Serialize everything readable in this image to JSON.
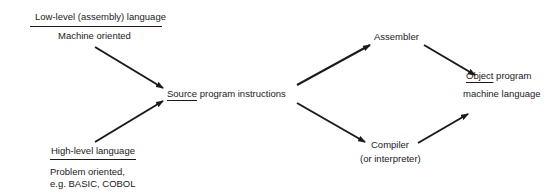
{
  "diagram": {
    "low_level": {
      "title": "Low-level (assembly) language",
      "subtitle": "Machine oriented"
    },
    "high_level": {
      "title": "High-level language",
      "subtitle_line1": "Problem oriented,",
      "subtitle_line2": "e.g. BASIC, COBOL"
    },
    "source": {
      "underlined": "Source",
      "rest": " program instructions"
    },
    "assembler": {
      "label": "Assembler"
    },
    "compiler": {
      "label": "Compiler",
      "sublabel": "(or interpreter)"
    },
    "object": {
      "underlined": "Object",
      "rest": " program",
      "sublabel": "machine language"
    },
    "edges": [
      {
        "from": "low_level",
        "to": "source"
      },
      {
        "from": "high_level",
        "to": "source"
      },
      {
        "from": "source",
        "to": "assembler"
      },
      {
        "from": "source",
        "to": "compiler"
      },
      {
        "from": "assembler",
        "to": "object"
      },
      {
        "from": "compiler",
        "to": "object"
      }
    ],
    "line_color": "#1a1a1a"
  }
}
